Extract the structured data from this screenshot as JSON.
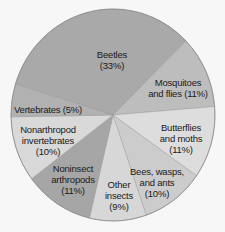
{
  "chart_data": {
    "type": "pie",
    "title": "",
    "start_angle_deg": 197,
    "direction": "clockwise",
    "legend": "none (labels inside slices)",
    "slices": [
      {
        "name": "Beetles",
        "value": 33,
        "label_lines": [
          "Beetles",
          "(33%)"
        ],
        "color": "#a9a9a9",
        "label_pos": [
          112,
          60
        ]
      },
      {
        "name": "Mosquitoes and flies",
        "value": 11,
        "label_lines": [
          "Mosquitoes",
          "and flies (11%)"
        ],
        "color": "#bdbdbd",
        "label_pos": [
          178,
          88
        ]
      },
      {
        "name": "Butterflies and moths",
        "value": 11,
        "label_lines": [
          "Butterflies",
          "and moths",
          "(11%)"
        ],
        "color": "#dddddd",
        "label_pos": [
          181,
          138
        ]
      },
      {
        "name": "Bees, wasps, and ants",
        "value": 10,
        "label_lines": [
          "Bees, wasps,",
          "and ants",
          "(10%)"
        ],
        "color": "#cccccc",
        "label_pos": [
          157,
          182
        ]
      },
      {
        "name": "Other insects",
        "value": 9,
        "label_lines": [
          "Other",
          "insects",
          "(9%)"
        ],
        "color": "#d7d7d7",
        "label_pos": [
          119,
          195
        ]
      },
      {
        "name": "Noninsect arthropods",
        "value": 11,
        "label_lines": [
          "Noninsect",
          "arthropods",
          "(11%)"
        ],
        "color": "#a6a6a6",
        "label_pos": [
          73,
          179
        ]
      },
      {
        "name": "Nonarthropod invertebrates",
        "value": 10,
        "label_lines": [
          "Nonarthropod",
          "invertebrates",
          "(10%)"
        ],
        "color": "#d9d9d9",
        "label_pos": [
          48,
          140
        ]
      },
      {
        "name": "Vertebrates",
        "value": 5,
        "label_lines": [
          "Vertebrates (5%)"
        ],
        "color": "#b1b1b1",
        "label_pos": [
          48,
          109
        ]
      }
    ],
    "geometry": {
      "cx": 113,
      "cy": 115,
      "rx": 102,
      "ry": 106
    }
  }
}
